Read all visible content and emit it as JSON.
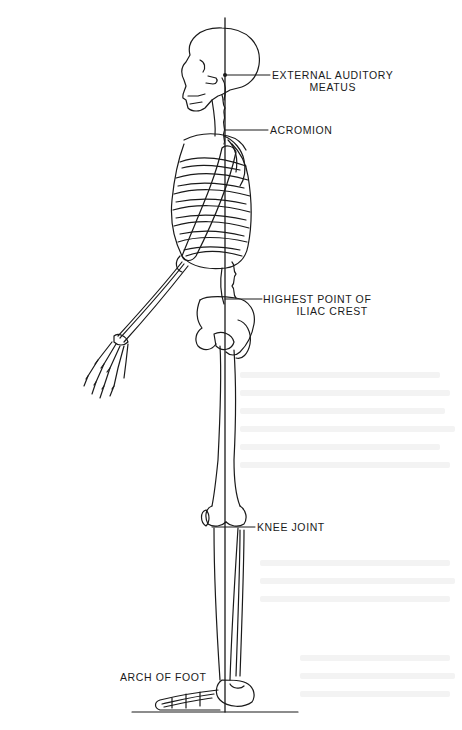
{
  "figure": {
    "line_color": "#1a1a1a",
    "background": "#ffffff"
  },
  "labels": {
    "ear": {
      "line1": "EXTERNAL AUDITORY",
      "line2": "MEATUS"
    },
    "shoulder": {
      "line1": "ACROMION"
    },
    "hip": {
      "line1": "HIGHEST POINT OF",
      "line2": "ILIAC CREST"
    },
    "knee": {
      "line1": "KNEE JOINT"
    },
    "foot": {
      "line1": "ARCH OF FOOT"
    }
  }
}
